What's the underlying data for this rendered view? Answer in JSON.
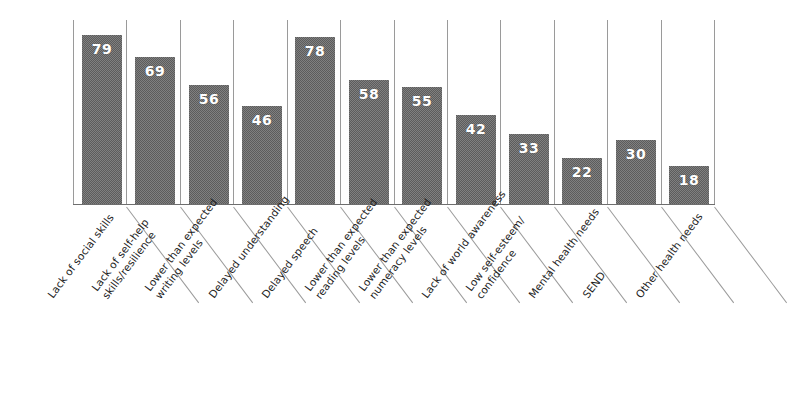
{
  "chart_data": {
    "type": "bar",
    "title": "",
    "subtitle": "",
    "xlabel": "",
    "ylabel": "",
    "ylim": [
      0,
      86
    ],
    "grid": "vertical-category-dividers",
    "legend": "none",
    "orientation": "vertical",
    "value_label_position": "inside-top",
    "categories": [
      "Lack of social skills",
      "Lack of self-help skills/resilience",
      "Lower than expected writing levels",
      "Delayed understanding",
      "Delayed speech",
      "Lower than expected reading levels",
      "Lower than expected numeracy levels",
      "Lack of world awareness",
      "Low self-esteem/confidence",
      "Mental health needs",
      "SEND",
      "Other health needs"
    ],
    "category_lines": [
      [
        "Lack of social skills",
        ""
      ],
      [
        "Lack of self-help",
        "skills/resilience"
      ],
      [
        "Lower than expected",
        "writing levels"
      ],
      [
        "Delayed understanding",
        ""
      ],
      [
        "Delayed speech",
        ""
      ],
      [
        "Lower than expected",
        "reading levels"
      ],
      [
        "Lower than expected",
        "numeracy levels"
      ],
      [
        "Lack of world awareness",
        ""
      ],
      [
        "Low self-esteem/",
        "confidence"
      ],
      [
        "Mental health needs",
        ""
      ],
      [
        "SEND",
        ""
      ],
      [
        "Other health needs",
        ""
      ]
    ],
    "values": [
      79,
      69,
      56,
      46,
      78,
      58,
      55,
      42,
      33,
      22,
      30,
      18
    ],
    "colors": {
      "bar_fill": "#5c5c5c",
      "value_label": "#ffffff",
      "gridline": "#9a9a9a",
      "axis": "#6e6e6e",
      "category_label": "#1d1d1d",
      "background": "#ffffff"
    }
  }
}
